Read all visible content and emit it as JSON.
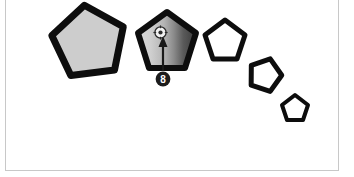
{
  "canvas": {
    "background_color": "#ffffff",
    "border_color": "#c8c8c8",
    "width": 354,
    "height": 177
  },
  "annotation": {
    "step_number": "8",
    "badge_color": "#1c1c1c",
    "badge_text_color": "#ffffff",
    "arrow_color": "#1a1a1a",
    "pointer_icon": "cursor-click-icon"
  },
  "shapes": {
    "stroke_color": "#0d0d0d",
    "items": [
      {
        "name": "pentagon-1",
        "label": "Pentagon 1",
        "fill": "#cdcdcd",
        "fill_type": "solid",
        "cx": 89,
        "cy": 43,
        "r": 38,
        "rotation": -7,
        "stroke_width": 7,
        "selected": "false"
      },
      {
        "name": "pentagon-2",
        "label": "Pentagon 2",
        "fill": "#c9c9c9",
        "fill_end": "#3d3d3d",
        "fill_type": "gradient",
        "cx": 167,
        "cy": 43,
        "r": 31,
        "rotation": 0,
        "stroke_width": 6,
        "selected": "true"
      },
      {
        "name": "pentagon-3",
        "label": "Pentagon 3",
        "fill": "#ffffff",
        "fill_type": "none",
        "cx": 225,
        "cy": 41,
        "r": 21,
        "rotation": 0,
        "stroke_width": 5,
        "selected": "false"
      },
      {
        "name": "pentagon-4",
        "label": "Pentagon 4",
        "fill": "#ffffff",
        "fill_type": "none",
        "cx": 265,
        "cy": 75,
        "r": 17,
        "rotation": 18,
        "stroke_width": 5,
        "selected": "false"
      },
      {
        "name": "pentagon-5",
        "label": "Pentagon 5",
        "fill": "#ffffff",
        "fill_type": "none",
        "cx": 295,
        "cy": 108,
        "r": 14,
        "rotation": 0,
        "stroke_width": 4,
        "selected": "false"
      }
    ]
  }
}
